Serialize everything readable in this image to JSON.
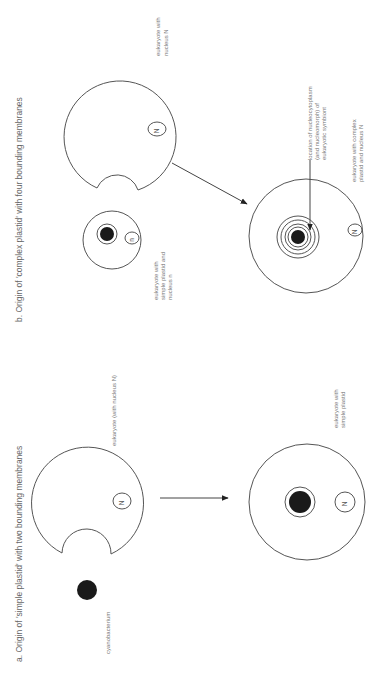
{
  "figure": {
    "orientation": "rotated 90 degrees counter-clockwise",
    "panel_a": {
      "title": "a. Origin of 'simple plastid' with two bounding membranes",
      "host_label": "eukaryote (with nucleus N)",
      "host_nucleus": "N",
      "symbiont_label": "cyanobacterium",
      "result_label_line1": "eukaryote with",
      "result_label_line2": "simple plastid",
      "result_nucleus": "N"
    },
    "panel_b": {
      "title": "b. Origin of 'complex plastid' with four bounding membranes",
      "host_label_line1": "eukaryote with",
      "host_label_line2": "nucleus N",
      "host_nucleus": "N",
      "symbiont_label_line1": "eukaryote with",
      "symbiont_label_line2": "simple plastid and",
      "symbiont_label_line3": "nucleus n",
      "symbiont_nucleus": "n",
      "pointer_label_line1": "location of nucleocytoplasm",
      "pointer_label_line2": "(and nucleomorph) of",
      "pointer_label_line3": "eukaryotic symbiont",
      "result_label_line1": "eukaryote with complex",
      "result_label_line2": "plastid and nucleus N",
      "result_nucleus": "N"
    },
    "colors": {
      "line": "#555555",
      "plastid_fill": "#1a1a1a",
      "text": "#666666",
      "background": "#ffffff"
    }
  }
}
